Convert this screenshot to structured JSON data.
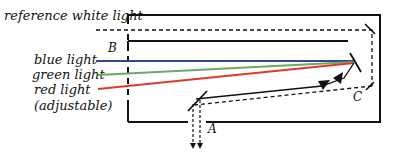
{
  "diagram": {
    "labels": {
      "reference": "reference white light",
      "blue": "blue light",
      "green": "green light",
      "red": "red light",
      "adjustable": "(adjustable)",
      "point_a": "A",
      "point_b": "B",
      "point_c": "C"
    },
    "colors": {
      "blue": "#2f4a8c",
      "green": "#6aaa64",
      "red": "#e0392b",
      "frame": "#111111"
    }
  }
}
